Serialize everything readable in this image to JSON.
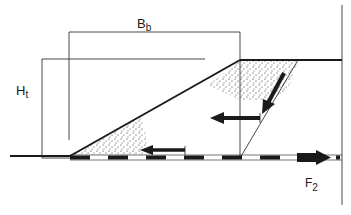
{
  "figure": {
    "type": "embankment-cross-section",
    "labels": {
      "width_label": "B",
      "width_sub": "b",
      "height_label": "H",
      "height_sub": "t",
      "force_label": "F",
      "force_sub": "2"
    },
    "colors": {
      "ink": "#1a1a1a",
      "background": "#ffffff",
      "stipple": "#2a2a2a"
    },
    "elements": [
      {
        "name": "embankment-slope",
        "description": "slope line from toe to crest"
      },
      {
        "name": "crest-surface",
        "description": "horizontal crest at top right"
      },
      {
        "name": "ground-surface",
        "description": "horizontal ground line at left"
      },
      {
        "name": "base-reinforcement",
        "description": "dashed base layer along foundation"
      },
      {
        "name": "failure-wedge-line",
        "description": "thin inclined failure plane"
      },
      {
        "name": "arrow-down-slope",
        "description": "arrow along failure plane"
      },
      {
        "name": "arrow-horizontal-upper",
        "description": "leftward thrust arrow"
      },
      {
        "name": "arrow-horizontal-lower",
        "description": "leftward arrow near toe"
      },
      {
        "name": "arrow-tension-F2",
        "description": "rightward tension arrow on base"
      }
    ]
  }
}
